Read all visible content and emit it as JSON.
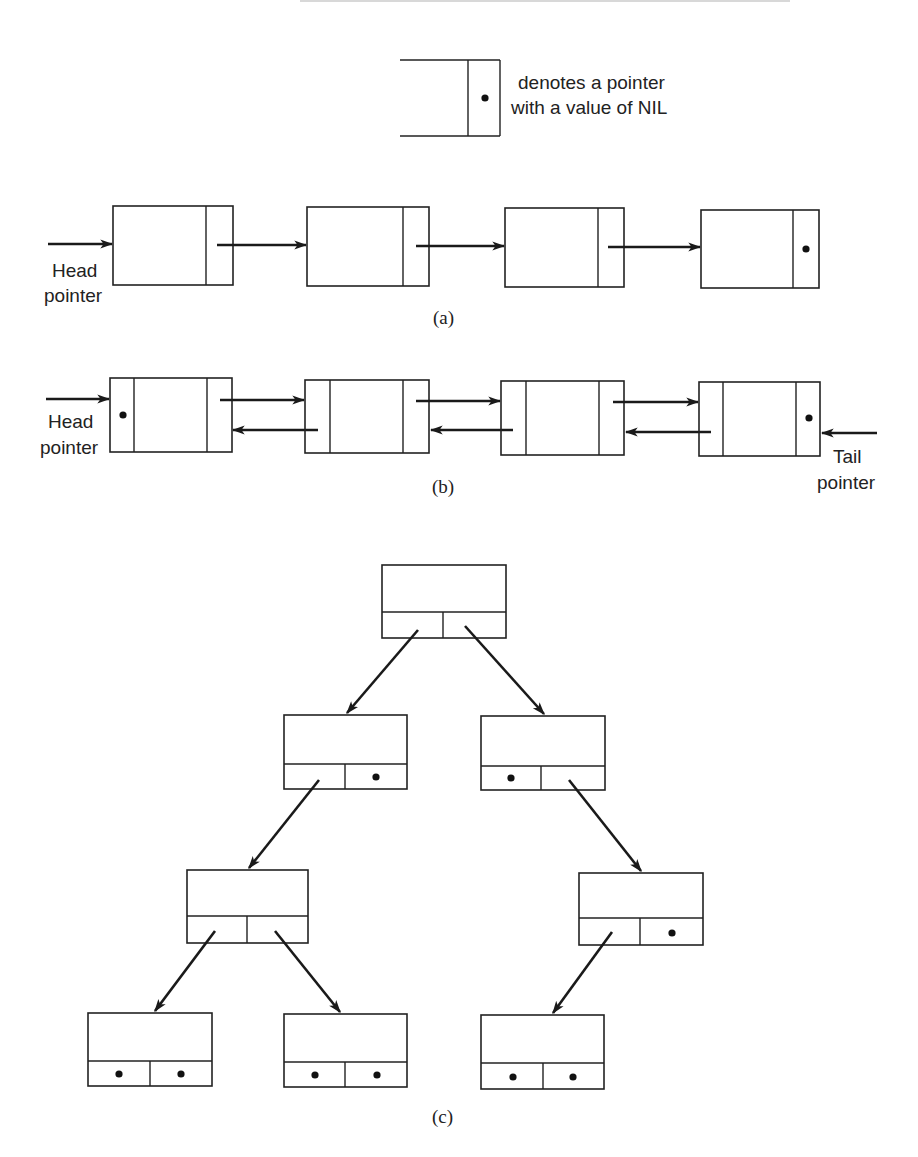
{
  "legend": {
    "line1": "denotes a pointer",
    "line2": "with a value of NIL",
    "icon": "nil-pointer-dot-icon"
  },
  "figure_a": {
    "caption": "(a)",
    "type": "singly linked list",
    "head_label_line1": "Head",
    "head_label_line2": "pointer",
    "node_count": 4,
    "last_node_next": "NIL"
  },
  "figure_b": {
    "caption": "(b)",
    "type": "doubly linked list",
    "head_label_line1": "Head",
    "head_label_line2": "pointer",
    "tail_label_line1": "Tail",
    "tail_label_line2": "pointer",
    "node_count": 4,
    "first_node_prev": "NIL",
    "last_node_next": "NIL"
  },
  "figure_c": {
    "caption": "(c)",
    "type": "binary tree",
    "nodes": [
      {
        "id": "root",
        "left": "n1",
        "right": "n2"
      },
      {
        "id": "n1",
        "left": "n3",
        "right": "NIL"
      },
      {
        "id": "n2",
        "left": "NIL",
        "right": "n4"
      },
      {
        "id": "n3",
        "left": "n5",
        "right": "n6"
      },
      {
        "id": "n4",
        "left": "n7",
        "right": "NIL"
      },
      {
        "id": "n5",
        "left": "NIL",
        "right": "NIL"
      },
      {
        "id": "n6",
        "left": "NIL",
        "right": "NIL"
      },
      {
        "id": "n7",
        "left": "NIL",
        "right": "NIL"
      }
    ]
  },
  "colors": {
    "ink": "#222222",
    "background": "#ffffff"
  }
}
